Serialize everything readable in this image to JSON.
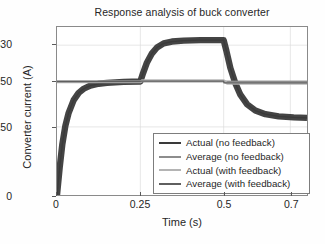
{
  "chart_data": {
    "type": "line",
    "title": "Response analysis of buck converter",
    "xlabel": "Time (s)",
    "ylabel": "Converter current (A)",
    "xlim": [
      0,
      0.75
    ],
    "ylim": [
      0,
      370
    ],
    "xticks": [
      "0",
      "0.25",
      "0.5",
      "0.7"
    ],
    "xtick_values": [
      0,
      0.25,
      0.5,
      0.7
    ],
    "yticks": [
      "0",
      "150",
      "250",
      "330"
    ],
    "ytick_values": [
      0,
      150,
      250,
      330
    ],
    "grid": true,
    "legend_position": "lower right",
    "series": [
      {
        "name": "Actual (no feedback)",
        "color": "#3a3a3a",
        "ripple": 14,
        "points": [
          [
            0.0,
            0
          ],
          [
            0.008,
            60
          ],
          [
            0.016,
            112
          ],
          [
            0.025,
            152
          ],
          [
            0.035,
            181
          ],
          [
            0.05,
            209
          ],
          [
            0.065,
            225
          ],
          [
            0.08,
            234
          ],
          [
            0.1,
            241
          ],
          [
            0.125,
            245
          ],
          [
            0.15,
            247
          ],
          [
            0.2,
            249
          ],
          [
            0.25,
            250
          ],
          [
            0.258,
            268
          ],
          [
            0.27,
            292
          ],
          [
            0.285,
            312
          ],
          [
            0.3,
            325
          ],
          [
            0.32,
            334
          ],
          [
            0.345,
            338
          ],
          [
            0.38,
            340
          ],
          [
            0.43,
            341
          ],
          [
            0.5,
            341
          ],
          [
            0.508,
            318
          ],
          [
            0.52,
            280
          ],
          [
            0.535,
            246
          ],
          [
            0.55,
            221
          ],
          [
            0.57,
            200
          ],
          [
            0.595,
            186
          ],
          [
            0.625,
            178
          ],
          [
            0.665,
            173
          ],
          [
            0.71,
            171
          ],
          [
            0.75,
            170
          ]
        ]
      },
      {
        "name": "Average (no feedback)",
        "color": "#8d8d8d",
        "ripple": 3,
        "points": [
          [
            0.0,
            250
          ],
          [
            0.25,
            250
          ],
          [
            0.5,
            250
          ],
          [
            0.75,
            250
          ]
        ]
      },
      {
        "name": "Actual (with feedback)",
        "color": "#b4b4b4",
        "ripple": 6,
        "points": [
          [
            0.0,
            249
          ],
          [
            0.12,
            249
          ],
          [
            0.25,
            249
          ],
          [
            0.255,
            252
          ],
          [
            0.3,
            252
          ],
          [
            0.4,
            252
          ],
          [
            0.5,
            252
          ],
          [
            0.51,
            246
          ],
          [
            0.6,
            246
          ],
          [
            0.7,
            246
          ],
          [
            0.75,
            246
          ]
        ]
      },
      {
        "name": "Average (with feedback)",
        "color": "#5f5f5f",
        "ripple": 0,
        "points": [
          [
            0.0,
            250
          ],
          [
            0.25,
            250
          ],
          [
            0.251,
            251
          ],
          [
            0.5,
            251
          ],
          [
            0.501,
            247
          ],
          [
            0.75,
            247
          ]
        ]
      }
    ]
  }
}
